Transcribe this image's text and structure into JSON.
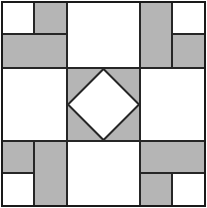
{
  "figure": {
    "width": 207,
    "height": 208
  },
  "colors": {
    "background": "#ffffff",
    "patch_light": "#ffffff",
    "patch_gray": "#b5b5b5",
    "outline": "#262626",
    "outer_border": "#1a1a1a"
  },
  "geometry": {
    "outer": {
      "x": 2,
      "y": 2,
      "width": 203,
      "height": 204
    },
    "grid_x": [
      2,
      67,
      140,
      205
    ],
    "grid_y": [
      2,
      68,
      141,
      206
    ],
    "corner_split_x": [
      34,
      172
    ],
    "corner_split_y": [
      34,
      173
    ],
    "line_width": 2,
    "border_width": 2.5
  },
  "cells": [
    {
      "name": "top-left-unit",
      "row": 0,
      "col": 0,
      "type": "corner-unit",
      "orientation": "white-square-top-left",
      "patches": [
        {
          "name": "white-square",
          "fill": "patch_light",
          "x": 2,
          "y": 2,
          "width": 32,
          "height": 32
        },
        {
          "name": "gray-vertical-rect",
          "fill": "patch_gray",
          "x": 34,
          "y": 2,
          "width": 33,
          "height": 32
        },
        {
          "name": "gray-horizontal-rect",
          "fill": "patch_gray",
          "x": 2,
          "y": 34,
          "width": 65,
          "height": 34
        }
      ]
    },
    {
      "name": "top-center-unit",
      "row": 0,
      "col": 1,
      "type": "plain-square",
      "patches": [
        {
          "name": "white-square",
          "fill": "patch_light",
          "x": 67,
          "y": 2,
          "width": 73,
          "height": 66
        }
      ]
    },
    {
      "name": "top-right-unit",
      "row": 0,
      "col": 2,
      "type": "corner-unit",
      "orientation": "white-square-top-right",
      "patches": [
        {
          "name": "gray-vertical-rect",
          "fill": "patch_gray",
          "x": 140,
          "y": 2,
          "width": 32,
          "height": 66
        },
        {
          "name": "white-square",
          "fill": "patch_light",
          "x": 172,
          "y": 2,
          "width": 33,
          "height": 32
        },
        {
          "name": "gray-horizontal-rect",
          "fill": "patch_gray",
          "x": 172,
          "y": 34,
          "width": 33,
          "height": 34
        }
      ]
    },
    {
      "name": "middle-left-unit",
      "row": 1,
      "col": 0,
      "type": "plain-square",
      "patches": [
        {
          "name": "white-square",
          "fill": "patch_light",
          "x": 2,
          "y": 68,
          "width": 65,
          "height": 73
        }
      ]
    },
    {
      "name": "center-unit",
      "row": 1,
      "col": 1,
      "type": "square-in-a-square",
      "patches": [
        {
          "name": "gray-background-square",
          "fill": "patch_gray",
          "x": 67,
          "y": 68,
          "width": 73,
          "height": 73
        },
        {
          "name": "white-diamond",
          "fill": "patch_light",
          "points": "103.5,69 139,104.5 103.5,140 68,104.5"
        }
      ]
    },
    {
      "name": "middle-right-unit",
      "row": 1,
      "col": 2,
      "type": "plain-square",
      "patches": [
        {
          "name": "white-square",
          "fill": "patch_light",
          "x": 140,
          "y": 68,
          "width": 65,
          "height": 73
        }
      ]
    },
    {
      "name": "bottom-left-unit",
      "row": 2,
      "col": 0,
      "type": "corner-unit",
      "orientation": "white-square-bottom-left",
      "patches": [
        {
          "name": "gray-square",
          "fill": "patch_gray",
          "x": 2,
          "y": 141,
          "width": 32,
          "height": 32
        },
        {
          "name": "gray-vertical-rect",
          "fill": "patch_gray",
          "x": 34,
          "y": 141,
          "width": 33,
          "height": 65
        },
        {
          "name": "white-square",
          "fill": "patch_light",
          "x": 2,
          "y": 173,
          "width": 32,
          "height": 33
        }
      ]
    },
    {
      "name": "bottom-center-unit",
      "row": 2,
      "col": 1,
      "type": "plain-square",
      "patches": [
        {
          "name": "white-square",
          "fill": "patch_light",
          "x": 67,
          "y": 141,
          "width": 73,
          "height": 65
        }
      ]
    },
    {
      "name": "bottom-right-unit",
      "row": 2,
      "col": 2,
      "type": "corner-unit",
      "orientation": "white-square-bottom-right",
      "patches": [
        {
          "name": "gray-horizontal-rect",
          "fill": "patch_gray",
          "x": 140,
          "y": 141,
          "width": 65,
          "height": 32
        },
        {
          "name": "gray-square",
          "fill": "patch_gray",
          "x": 140,
          "y": 173,
          "width": 32,
          "height": 33
        },
        {
          "name": "white-square",
          "fill": "patch_light",
          "x": 172,
          "y": 173,
          "width": 33,
          "height": 33
        }
      ]
    }
  ],
  "lines": [
    {
      "name": "grid-vertical-left",
      "x1": 67,
      "y1": 2,
      "x2": 67,
      "y2": 206
    },
    {
      "name": "grid-vertical-right",
      "x1": 140,
      "y1": 2,
      "x2": 140,
      "y2": 206
    },
    {
      "name": "grid-horizontal-top",
      "x1": 2,
      "y1": 68,
      "x2": 205,
      "y2": 68
    },
    {
      "name": "grid-horizontal-bottom",
      "x1": 2,
      "y1": 141,
      "x2": 205,
      "y2": 141
    },
    {
      "name": "tl-inner-vertical",
      "x1": 34,
      "y1": 2,
      "x2": 34,
      "y2": 34
    },
    {
      "name": "tl-inner-horizontal",
      "x1": 2,
      "y1": 34,
      "x2": 67,
      "y2": 34
    },
    {
      "name": "tr-inner-vertical",
      "x1": 172,
      "y1": 2,
      "x2": 172,
      "y2": 68
    },
    {
      "name": "tr-inner-horizontal",
      "x1": 172,
      "y1": 34,
      "x2": 205,
      "y2": 34
    },
    {
      "name": "bl-inner-vertical",
      "x1": 34,
      "y1": 141,
      "x2": 34,
      "y2": 206
    },
    {
      "name": "bl-inner-horizontal",
      "x1": 2,
      "y1": 173,
      "x2": 34,
      "y2": 173
    },
    {
      "name": "br-inner-vertical",
      "x1": 172,
      "y1": 173,
      "x2": 172,
      "y2": 206
    },
    {
      "name": "br-inner-horizontal",
      "x1": 140,
      "y1": 173,
      "x2": 205,
      "y2": 173
    }
  ]
}
